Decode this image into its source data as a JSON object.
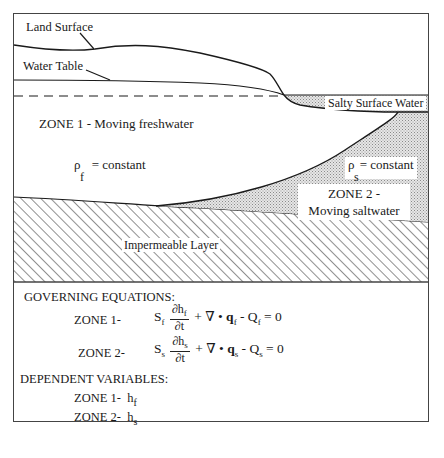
{
  "diagram": {
    "labels": {
      "land_surface": "Land Surface",
      "water_table": "Water Table",
      "salty_surface_water": "Salty Surface Water",
      "zone1": "ZONE 1 - Moving freshwater",
      "zone2_line1": "ZONE 2 -",
      "zone2_line2": "Moving saltwater",
      "impermeable_layer": "Impermeable Layer"
    },
    "density_freshwater": {
      "symbol": "ρ",
      "subscript": "f",
      "text": "= constant"
    },
    "density_saltwater": {
      "symbol": "ρ",
      "subscript": "s",
      "text": "= constant"
    },
    "colors": {
      "line": "#1a1a1a",
      "saltwater_fill": "#c8c8c8",
      "hatch": "#333333",
      "frame": "#444444"
    }
  },
  "equations": {
    "heading": "GOVERNING EQUATIONS:",
    "zone1": {
      "label": "ZONE 1-",
      "S": "S",
      "S_sub": "f",
      "num": "∂h",
      "num_sub": "f",
      "den": "∂t",
      "plus_div": "+ ∇ •",
      "q": "q",
      "q_sub": "f",
      "minus_Q": "- Q",
      "Q_sub": "f",
      "rhs": "= 0"
    },
    "zone2": {
      "label": "ZONE 2-",
      "S": "S",
      "S_sub": "s",
      "num": "∂h",
      "num_sub": "s",
      "den": "∂t",
      "plus_div": "+ ∇ •",
      "q": "q",
      "q_sub": "s",
      "minus_Q": "- Q",
      "Q_sub": "s",
      "rhs": "= 0"
    }
  },
  "dependent_variables": {
    "heading": "DEPENDENT VARIABLES:",
    "zone1": {
      "label": "ZONE 1-",
      "var": "h",
      "sub": "f"
    },
    "zone2": {
      "label": "ZONE 2-",
      "var": "h",
      "sub": "s"
    }
  }
}
